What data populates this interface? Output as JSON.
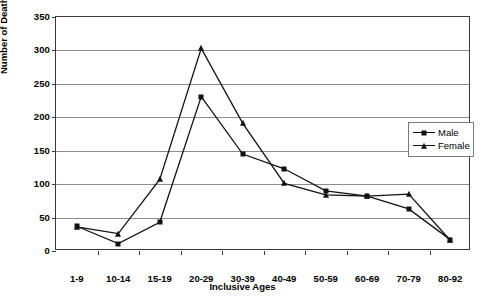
{
  "chart_data": {
    "type": "line",
    "title": "",
    "xlabel": "Inclusive Ages",
    "ylabel": "Number of Deaths",
    "categories": [
      "1-9",
      "10-14",
      "15-19",
      "20-29",
      "30-39",
      "40-49",
      "50-59",
      "60-69",
      "70-79",
      "80-92"
    ],
    "series": [
      {
        "name": "Male",
        "marker": "square",
        "values": [
          37,
          11,
          43,
          231,
          145,
          123,
          90,
          82,
          63,
          17
        ]
      },
      {
        "name": "Female",
        "marker": "triangle",
        "values": [
          36,
          26,
          107,
          303,
          191,
          101,
          84,
          82,
          85,
          16
        ]
      }
    ],
    "ylim": [
      0,
      350
    ],
    "yticks": [
      0,
      50,
      100,
      150,
      200,
      250,
      300,
      350
    ],
    "ytick_labels": [
      "0",
      "50",
      "100",
      "150",
      "200",
      "250",
      "300",
      "350"
    ],
    "grid": true,
    "legend_position": "inside-right",
    "line_color": "#111111",
    "grid_color": "#8c8c8c",
    "axis_color": "#3a3a3a"
  },
  "legend": {
    "entries": [
      {
        "label": "Male"
      },
      {
        "label": "Female"
      }
    ]
  }
}
